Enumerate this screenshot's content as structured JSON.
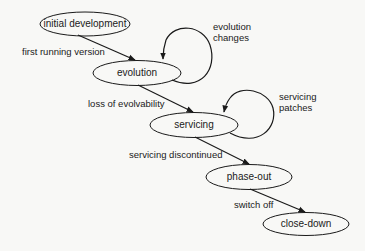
{
  "diagram": {
    "title": "",
    "nodes": [
      {
        "id": "initial-development",
        "label": "initial development",
        "cx": 85,
        "cy": 24,
        "rx": 45,
        "ry": 12
      },
      {
        "id": "evolution",
        "label": "evolution",
        "cx": 137,
        "cy": 73,
        "rx": 44,
        "ry": 12
      },
      {
        "id": "servicing",
        "label": "servicing",
        "cx": 194,
        "cy": 125,
        "rx": 44,
        "ry": 12
      },
      {
        "id": "phase-out",
        "label": "phase-out",
        "cx": 249,
        "cy": 177,
        "rx": 43,
        "ry": 12
      },
      {
        "id": "close-down",
        "label": "close-down",
        "cx": 306,
        "cy": 224,
        "rx": 43,
        "ry": 12
      }
    ],
    "edges": [
      {
        "from": "initial-development",
        "to": "evolution",
        "label": "first running version"
      },
      {
        "from": "evolution",
        "to": "evolution",
        "label_line1": "evolution",
        "label_line2": "changes"
      },
      {
        "from": "evolution",
        "to": "servicing",
        "label": "loss of evolvability"
      },
      {
        "from": "servicing",
        "to": "servicing",
        "label_line1": "servicing",
        "label_line2": "patches"
      },
      {
        "from": "servicing",
        "to": "phase-out",
        "label": "servicing discontinued"
      },
      {
        "from": "phase-out",
        "to": "close-down",
        "label": "switch off"
      }
    ],
    "colors": {
      "stroke": "#1a1a1a",
      "background": "#f8f8f6",
      "text": "#1a1a1a"
    }
  }
}
